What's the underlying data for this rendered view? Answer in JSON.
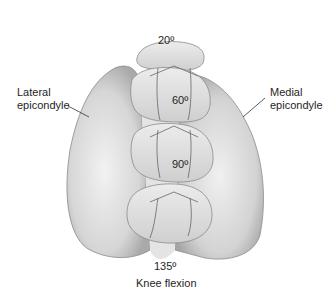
{
  "diagram": {
    "type": "anatomical-illustration",
    "labels": {
      "lateral_line1": "Lateral",
      "lateral_line2": "epicondyle",
      "medial_line1": "Medial",
      "medial_line2": "epicondyle",
      "caption": "Knee flexion"
    },
    "angles": [
      {
        "label": "20º",
        "position": "top"
      },
      {
        "label": "60º",
        "position": "upper-middle"
      },
      {
        "label": "90º",
        "position": "lower-middle"
      },
      {
        "label": "135º",
        "position": "bottom"
      }
    ],
    "colors": {
      "bone_fill": "#dcdcdc",
      "bone_shadow": "#a8a8a8",
      "outline": "#6a6a6a",
      "text": "#1e1e1e",
      "background": "#ffffff"
    }
  }
}
